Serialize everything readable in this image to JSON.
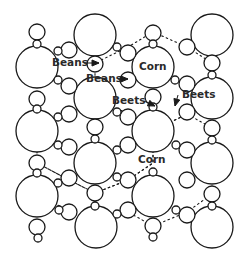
{
  "diagram": {
    "type": "intercropping-plant-layout",
    "colors": {
      "stroke": "#1a1a1a",
      "background": "#ffffff",
      "label": "#2a2a2a"
    },
    "labels": [
      {
        "id": "beans-1",
        "text": "Beans",
        "x": 52,
        "y": 66,
        "arrow_to": [
          99,
          63
        ]
      },
      {
        "id": "beans-2",
        "text": "Beans",
        "x": 86,
        "y": 82,
        "arrow_to": [
          128,
          79
        ]
      },
      {
        "id": "beets-1",
        "text": "Beets",
        "x": 112,
        "y": 104,
        "arrow_to": [
          155,
          106
        ]
      },
      {
        "id": "beets-2",
        "text": "Beets",
        "x": 182,
        "y": 98,
        "arrow_to": [
          175,
          106
        ]
      },
      {
        "id": "corn-1",
        "text": "Corn",
        "x": 139,
        "y": 70
      },
      {
        "id": "corn-2",
        "text": "Corn",
        "x": 138,
        "y": 163
      }
    ],
    "large_circles": [
      {
        "cx": 37,
        "cy": 67,
        "r": 21
      },
      {
        "cx": 37,
        "cy": 131,
        "r": 21
      },
      {
        "cx": 37,
        "cy": 196,
        "r": 21
      },
      {
        "cx": 95,
        "cy": 35,
        "r": 21
      },
      {
        "cx": 95,
        "cy": 98,
        "r": 21
      },
      {
        "cx": 95,
        "cy": 163,
        "r": 21
      },
      {
        "cx": 96,
        "cy": 227,
        "r": 21
      },
      {
        "cx": 153,
        "cy": 67,
        "r": 21
      },
      {
        "cx": 153,
        "cy": 131,
        "r": 21
      },
      {
        "cx": 153,
        "cy": 196,
        "r": 21
      },
      {
        "cx": 212,
        "cy": 35,
        "r": 21
      },
      {
        "cx": 212,
        "cy": 98,
        "r": 21
      },
      {
        "cx": 212,
        "cy": 163,
        "r": 21
      },
      {
        "cx": 212,
        "cy": 227,
        "r": 21
      }
    ],
    "medium_circles": [
      {
        "cx": 37,
        "cy": 32,
        "r": 8
      },
      {
        "cx": 37,
        "cy": 99,
        "r": 8
      },
      {
        "cx": 37,
        "cy": 163,
        "r": 8
      },
      {
        "cx": 37,
        "cy": 227,
        "r": 8
      },
      {
        "cx": 69,
        "cy": 50,
        "r": 8
      },
      {
        "cx": 69,
        "cy": 86,
        "r": 8
      },
      {
        "cx": 69,
        "cy": 114,
        "r": 8
      },
      {
        "cx": 69,
        "cy": 147,
        "r": 8
      },
      {
        "cx": 69,
        "cy": 178,
        "r": 8
      },
      {
        "cx": 69,
        "cy": 212,
        "r": 8
      },
      {
        "cx": 95,
        "cy": 64,
        "r": 8
      },
      {
        "cx": 95,
        "cy": 127,
        "r": 8
      },
      {
        "cx": 95,
        "cy": 193,
        "r": 8
      },
      {
        "cx": 128,
        "cy": 53,
        "r": 8
      },
      {
        "cx": 128,
        "cy": 80,
        "r": 8
      },
      {
        "cx": 128,
        "cy": 117,
        "r": 8
      },
      {
        "cx": 128,
        "cy": 145,
        "r": 8
      },
      {
        "cx": 128,
        "cy": 180,
        "r": 8
      },
      {
        "cx": 128,
        "cy": 210,
        "r": 8
      },
      {
        "cx": 153,
        "cy": 33,
        "r": 8
      },
      {
        "cx": 153,
        "cy": 97,
        "r": 8
      },
      {
        "cx": 153,
        "cy": 226,
        "r": 8
      },
      {
        "cx": 187,
        "cy": 47,
        "r": 8
      },
      {
        "cx": 187,
        "cy": 84,
        "r": 8
      },
      {
        "cx": 187,
        "cy": 112,
        "r": 8
      },
      {
        "cx": 187,
        "cy": 150,
        "r": 8
      },
      {
        "cx": 187,
        "cy": 180,
        "r": 8
      },
      {
        "cx": 187,
        "cy": 215,
        "r": 8
      },
      {
        "cx": 212,
        "cy": 63,
        "r": 8
      },
      {
        "cx": 212,
        "cy": 128,
        "r": 8
      },
      {
        "cx": 212,
        "cy": 194,
        "r": 8
      }
    ],
    "small_circles": [
      {
        "cx": 37,
        "cy": 44,
        "r": 4
      },
      {
        "cx": 37,
        "cy": 109,
        "r": 4
      },
      {
        "cx": 37,
        "cy": 173,
        "r": 4
      },
      {
        "cx": 38,
        "cy": 238,
        "r": 4
      },
      {
        "cx": 58,
        "cy": 51,
        "r": 4
      },
      {
        "cx": 58,
        "cy": 80,
        "r": 4
      },
      {
        "cx": 58,
        "cy": 117,
        "r": 4
      },
      {
        "cx": 58,
        "cy": 145,
        "r": 4
      },
      {
        "cx": 58,
        "cy": 183,
        "r": 4
      },
      {
        "cx": 59,
        "cy": 210,
        "r": 4
      },
      {
        "cx": 95,
        "cy": 139,
        "r": 4
      },
      {
        "cx": 95,
        "cy": 206,
        "r": 4
      },
      {
        "cx": 117,
        "cy": 47,
        "r": 4
      },
      {
        "cx": 117,
        "cy": 112,
        "r": 4
      },
      {
        "cx": 117,
        "cy": 150,
        "r": 4
      },
      {
        "cx": 117,
        "cy": 177,
        "r": 4
      },
      {
        "cx": 117,
        "cy": 214,
        "r": 4
      },
      {
        "cx": 153,
        "cy": 44,
        "r": 4
      },
      {
        "cx": 153,
        "cy": 107,
        "r": 4
      },
      {
        "cx": 153,
        "cy": 172,
        "r": 4
      },
      {
        "cx": 153,
        "cy": 237,
        "r": 4
      },
      {
        "cx": 175,
        "cy": 80,
        "r": 4
      },
      {
        "cx": 176,
        "cy": 145,
        "r": 4
      },
      {
        "cx": 176,
        "cy": 210,
        "r": 4
      },
      {
        "cx": 212,
        "cy": 75,
        "r": 4
      },
      {
        "cx": 212,
        "cy": 140,
        "r": 4
      },
      {
        "cx": 212,
        "cy": 206,
        "r": 4
      }
    ],
    "root_zones": [
      {
        "id": "hex-top-right",
        "points": "153,32 187,47 212,63 212,98 187,114 153,131 128,114 95,98 95,63 128,47 153,32"
      },
      {
        "id": "hex-mid-left",
        "points": "95,98 128,114 153,131 153,163 128,180 95,193 69,180 37,163 37,131 69,114 95,98"
      },
      {
        "id": "hex-mid-right",
        "points": "153,131 187,114 212,128 212,163 212,194 187,212 153,226 128,212 95,226 95,193 128,180 153,163 153,131"
      },
      {
        "id": "hex-bottom-left",
        "points": "37,163 69,180 95,193 95,226 69,210 37,196 37,163"
      }
    ],
    "root_spokes": [
      {
        "x1": 95,
        "y1": 98,
        "x2": 95,
        "y2": 80
      },
      {
        "x1": 95,
        "y1": 98,
        "x2": 78,
        "y2": 108
      },
      {
        "x1": 95,
        "y1": 98,
        "x2": 112,
        "y2": 108
      },
      {
        "x1": 153,
        "y1": 131,
        "x2": 153,
        "y2": 113
      },
      {
        "x1": 153,
        "y1": 131,
        "x2": 136,
        "y2": 121
      },
      {
        "x1": 153,
        "y1": 131,
        "x2": 170,
        "y2": 141
      },
      {
        "x1": 37,
        "y1": 196,
        "x2": 37,
        "y2": 178
      },
      {
        "x1": 37,
        "y1": 196,
        "x2": 54,
        "y2": 206
      },
      {
        "x1": 212,
        "y1": 98,
        "x2": 212,
        "y2": 80
      },
      {
        "x1": 212,
        "y1": 98,
        "x2": 212,
        "y2": 116
      }
    ]
  }
}
